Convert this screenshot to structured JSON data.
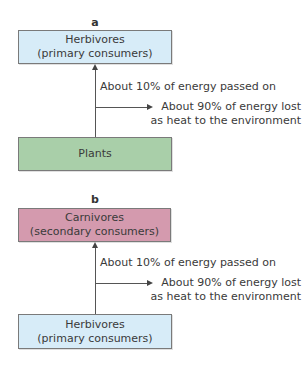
{
  "colors": {
    "herbivores": "#d7ecf8",
    "plants": "#a9cfa9",
    "carnivores": "#d49aae"
  },
  "panels": [
    {
      "label": "a",
      "top_box": {
        "line1": "Herbivores",
        "line2": "(primary consumers)"
      },
      "bottom_box": {
        "line1": "Plants"
      },
      "passed_on": "About 10% of energy passed on",
      "lost_line1": "About 90% of energy lost",
      "lost_line2": "as heat to the environment"
    },
    {
      "label": "b",
      "top_box": {
        "line1": "Carnivores",
        "line2": "(secondary consumers)"
      },
      "bottom_box": {
        "line1": "Herbivores",
        "line2": "(primary consumers)"
      },
      "passed_on": "About 10% of energy passed on",
      "lost_line1": "About 90% of energy lost",
      "lost_line2": "as heat to the environment"
    }
  ]
}
